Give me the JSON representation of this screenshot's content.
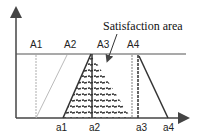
{
  "diagram": {
    "annotation": "Satisfaction area",
    "upper_labels": [
      "A1",
      "A2",
      "A3",
      "A4"
    ],
    "lower_labels": [
      "a1",
      "a2",
      "a3",
      "a4"
    ],
    "colors": {
      "dark": "#333333",
      "light": "#aaaaaa",
      "hatch": "#333333"
    }
  }
}
